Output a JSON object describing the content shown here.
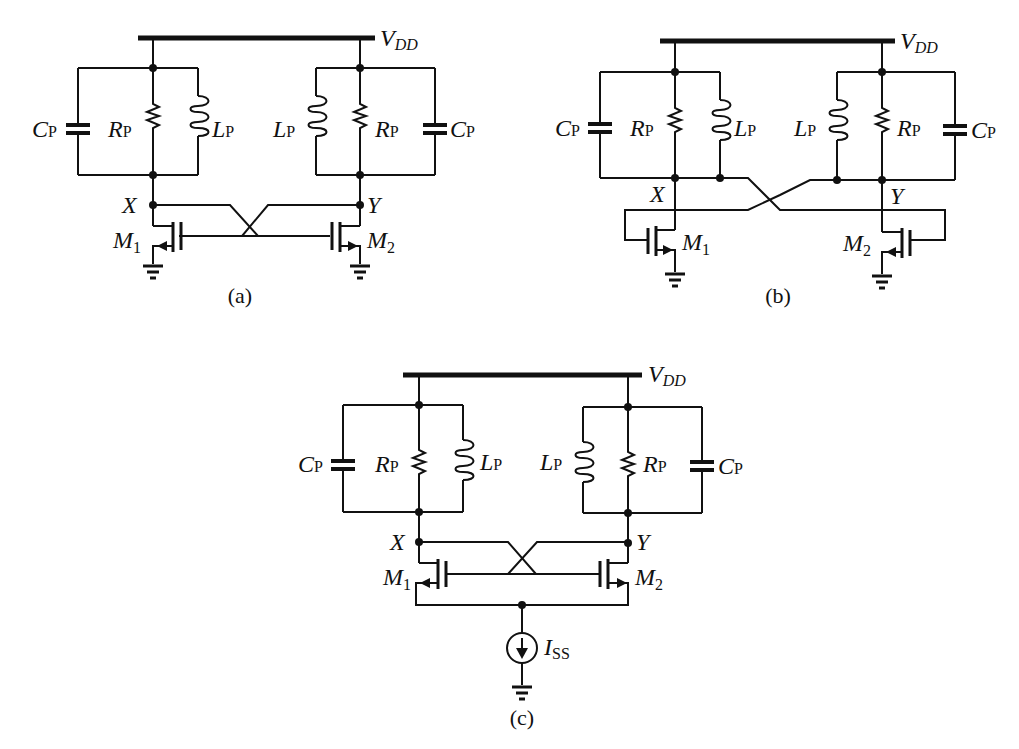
{
  "figure": {
    "panels": [
      {
        "id": "a",
        "caption": "(a)",
        "supply_label": "V",
        "supply_sub": "DD",
        "components": {
          "left": {
            "cap": "C",
            "cap_sub": "P",
            "res": "R",
            "res_sub": "P",
            "ind": "L",
            "ind_sub": "P"
          },
          "right": {
            "cap": "C",
            "cap_sub": "P",
            "res": "R",
            "res_sub": "P",
            "ind": "L",
            "ind_sub": "P"
          }
        },
        "nodes": {
          "left": "X",
          "right": "Y"
        },
        "transistors": {
          "left": "M",
          "left_sub": "1",
          "right": "M",
          "right_sub": "2"
        }
      },
      {
        "id": "b",
        "caption": "(b)",
        "supply_label": "V",
        "supply_sub": "DD",
        "components": {
          "left": {
            "cap": "C",
            "cap_sub": "P",
            "res": "R",
            "res_sub": "P",
            "ind": "L",
            "ind_sub": "P"
          },
          "right": {
            "cap": "C",
            "cap_sub": "P",
            "res": "R",
            "res_sub": "P",
            "ind": "L",
            "ind_sub": "P"
          }
        },
        "nodes": {
          "left": "X",
          "right": "Y"
        },
        "transistors": {
          "left": "M",
          "left_sub": "1",
          "right": "M",
          "right_sub": "2"
        }
      },
      {
        "id": "c",
        "caption": "(c)",
        "supply_label": "V",
        "supply_sub": "DD",
        "components": {
          "left": {
            "cap": "C",
            "cap_sub": "P",
            "res": "R",
            "res_sub": "P",
            "ind": "L",
            "ind_sub": "P"
          },
          "right": {
            "cap": "C",
            "cap_sub": "P",
            "res": "R",
            "res_sub": "P",
            "ind": "L",
            "ind_sub": "P"
          }
        },
        "nodes": {
          "left": "X",
          "right": "Y"
        },
        "transistors": {
          "left": "M",
          "left_sub": "1",
          "right": "M",
          "right_sub": "2"
        },
        "current_source": {
          "label": "I",
          "sub": "SS"
        }
      }
    ]
  }
}
